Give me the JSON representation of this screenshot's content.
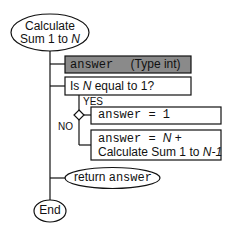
{
  "start": {
    "line1": "Calculate",
    "line2a": "Sum 1 to ",
    "line2b": "N"
  },
  "declaration": {
    "var": "answer",
    "type": "(Type int)",
    "fill": "#8a8a8a"
  },
  "condition": {
    "prefix": "Is ",
    "var": "N",
    "suffix": " equal to 1?"
  },
  "branch_labels": {
    "yes": "YES",
    "no": "NO"
  },
  "yes_action": {
    "code": "answer = 1"
  },
  "no_action": {
    "code": "answer = ",
    "n": "N",
    "plus": " +",
    "line2a": "Calculate Sum 1 to ",
    "line2b": "N-1"
  },
  "return": {
    "keyword": "return",
    "var": "answer"
  },
  "end": {
    "label": "End"
  }
}
